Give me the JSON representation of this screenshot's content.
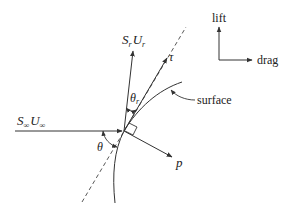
{
  "diagram": {
    "type": "force-vector-diagram",
    "colors": {
      "line": "#333333",
      "background": "#ffffff"
    },
    "labels": {
      "incoming_flux": {
        "main": "S",
        "sub": "∞",
        "main2": "U",
        "sub2": "∞"
      },
      "reflected_flux": {
        "main": "S",
        "sub": "r",
        "main2": "U",
        "sub2": "r"
      },
      "tangent": "τ",
      "normal": "p",
      "surface": "surface",
      "incidence_angle": "θ",
      "reflection_angle": {
        "main": "θ",
        "sub": "r"
      }
    },
    "axes_legend": {
      "vertical": "lift",
      "horizontal": "drag"
    }
  }
}
